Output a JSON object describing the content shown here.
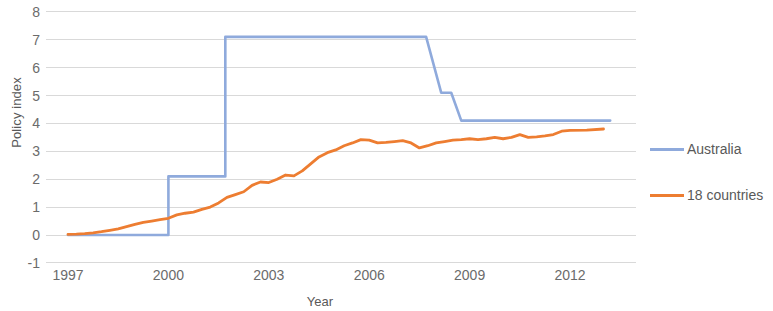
{
  "chart_data": {
    "type": "line",
    "title": "",
    "xlabel": "Year",
    "ylabel": "Policy index",
    "xlim": [
      1997,
      2013
    ],
    "ylim": [
      -1,
      8
    ],
    "yticks": [
      8,
      7,
      6,
      5,
      4,
      3,
      2,
      1,
      0,
      -1
    ],
    "xticks": [
      1997,
      2000,
      2003,
      2006,
      2009,
      2012
    ],
    "grid": true,
    "legend_position": "right",
    "colors": {
      "australia": "#8FAADC",
      "18_countries": "#ED7D31"
    },
    "series": [
      {
        "name": "Australia",
        "color": "#8FAADC",
        "style": "step",
        "points": [
          [
            1997.0,
            0.0
          ],
          [
            2000.0,
            0.0
          ],
          [
            2000.0,
            2.1
          ],
          [
            2001.7,
            2.1
          ],
          [
            2001.7,
            7.1
          ],
          [
            2007.7,
            7.1
          ],
          [
            2008.15,
            5.1
          ],
          [
            2008.45,
            5.1
          ],
          [
            2008.75,
            4.1
          ],
          [
            2013.2,
            4.1
          ]
        ]
      },
      {
        "name": "18 countries",
        "color": "#ED7D31",
        "style": "line",
        "points": [
          [
            1997.0,
            0.02
          ],
          [
            1997.25,
            0.03
          ],
          [
            1997.5,
            0.05
          ],
          [
            1997.75,
            0.08
          ],
          [
            1998.0,
            0.12
          ],
          [
            1998.25,
            0.17
          ],
          [
            1998.5,
            0.22
          ],
          [
            1998.75,
            0.3
          ],
          [
            1999.0,
            0.38
          ],
          [
            1999.25,
            0.45
          ],
          [
            1999.5,
            0.5
          ],
          [
            1999.75,
            0.55
          ],
          [
            2000.0,
            0.6
          ],
          [
            2000.25,
            0.72
          ],
          [
            2000.5,
            0.78
          ],
          [
            2000.75,
            0.82
          ],
          [
            2001.0,
            0.92
          ],
          [
            2001.25,
            1.0
          ],
          [
            2001.5,
            1.15
          ],
          [
            2001.75,
            1.35
          ],
          [
            2002.0,
            1.45
          ],
          [
            2002.25,
            1.55
          ],
          [
            2002.5,
            1.78
          ],
          [
            2002.75,
            1.9
          ],
          [
            2003.0,
            1.88
          ],
          [
            2003.25,
            2.0
          ],
          [
            2003.5,
            2.15
          ],
          [
            2003.75,
            2.12
          ],
          [
            2004.0,
            2.3
          ],
          [
            2004.25,
            2.55
          ],
          [
            2004.5,
            2.8
          ],
          [
            2004.75,
            2.95
          ],
          [
            2005.0,
            3.05
          ],
          [
            2005.25,
            3.2
          ],
          [
            2005.5,
            3.3
          ],
          [
            2005.75,
            3.42
          ],
          [
            2006.0,
            3.4
          ],
          [
            2006.25,
            3.3
          ],
          [
            2006.5,
            3.32
          ],
          [
            2006.75,
            3.35
          ],
          [
            2007.0,
            3.38
          ],
          [
            2007.25,
            3.3
          ],
          [
            2007.5,
            3.12
          ],
          [
            2007.75,
            3.2
          ],
          [
            2008.0,
            3.3
          ],
          [
            2008.25,
            3.35
          ],
          [
            2008.5,
            3.4
          ],
          [
            2008.75,
            3.42
          ],
          [
            2009.0,
            3.45
          ],
          [
            2009.25,
            3.42
          ],
          [
            2009.5,
            3.45
          ],
          [
            2009.75,
            3.5
          ],
          [
            2010.0,
            3.45
          ],
          [
            2010.25,
            3.5
          ],
          [
            2010.5,
            3.6
          ],
          [
            2010.75,
            3.5
          ],
          [
            2011.0,
            3.52
          ],
          [
            2011.25,
            3.55
          ],
          [
            2011.5,
            3.6
          ],
          [
            2011.75,
            3.72
          ],
          [
            2012.0,
            3.75
          ],
          [
            2012.5,
            3.76
          ],
          [
            2013.0,
            3.8
          ]
        ]
      }
    ]
  },
  "legend": {
    "items": [
      {
        "label": "Australia",
        "color": "#8FAADC"
      },
      {
        "label": "18 countries",
        "color": "#ED7D31"
      }
    ]
  }
}
